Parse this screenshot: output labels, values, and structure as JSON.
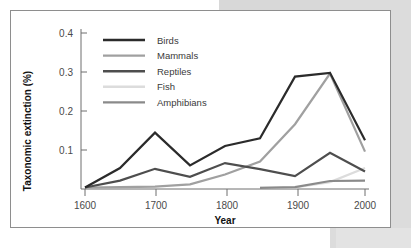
{
  "figure": {
    "background_color": "#ffffff",
    "page_background_color": "#d8d8d8",
    "border_color": "#8e8e8e"
  },
  "chart_data": {
    "type": "line",
    "title": "",
    "subtitle": "",
    "xlabel": "Year",
    "ylabel": "Taxonomic extinction (%)",
    "xlim": [
      1600,
      2000
    ],
    "ylim": [
      0,
      0.42
    ],
    "grid": false,
    "legend_position": "top-left-inside",
    "x_ticks": [
      1600,
      1700,
      1800,
      1900,
      2000
    ],
    "x_tick_labels": [
      "1600",
      "1700",
      "1800",
      "1900",
      "2000"
    ],
    "y_ticks": [
      0.1,
      0.2,
      0.3,
      0.4
    ],
    "y_tick_labels": [
      "0.1",
      "0.2",
      "0.3",
      "0.4"
    ],
    "x": [
      1600,
      1650,
      1700,
      1750,
      1800,
      1850,
      1900,
      1950,
      2000
    ],
    "series": [
      {
        "name": "Birds",
        "color": "#2b2b2b",
        "width": 2.2,
        "x": [
          1600,
          1650,
          1700,
          1750,
          1800,
          1850,
          1900,
          1950,
          2000
        ],
        "values": [
          0.004,
          0.055,
          0.148,
          0.062,
          0.113,
          0.133,
          0.295,
          0.305,
          0.128
        ]
      },
      {
        "name": "Mammals",
        "color": "#a0a0a0",
        "width": 2.2,
        "x": [
          1600,
          1650,
          1700,
          1750,
          1800,
          1850,
          1900,
          1950,
          2000
        ],
        "values": [
          0.004,
          0.005,
          0.006,
          0.012,
          0.038,
          0.072,
          0.17,
          0.303,
          0.098
        ]
      },
      {
        "name": "Reptiles",
        "color": "#4e4e4e",
        "width": 2.2,
        "x": [
          1600,
          1650,
          1700,
          1750,
          1800,
          1850,
          1900,
          1950,
          2000
        ],
        "values": [
          0.004,
          0.022,
          0.053,
          0.032,
          0.068,
          0.052,
          0.034,
          0.095,
          0.046
        ]
      },
      {
        "name": "Fish",
        "color": "#dcdcdc",
        "width": 2.2,
        "x": [
          1850,
          1900,
          1950,
          2000
        ],
        "values": [
          0.003,
          0.004,
          0.018,
          0.055
        ]
      },
      {
        "name": "Amphibians",
        "color": "#8a8a8a",
        "width": 2.2,
        "x": [
          1850,
          1900,
          1950,
          2000
        ],
        "values": [
          0.003,
          0.005,
          0.021,
          0.022
        ]
      }
    ],
    "legend": [
      {
        "label": "Birds",
        "color": "#2b2b2b"
      },
      {
        "label": "Mammals",
        "color": "#a0a0a0"
      },
      {
        "label": "Reptiles",
        "color": "#4e4e4e"
      },
      {
        "label": "Fish",
        "color": "#dcdcdc"
      },
      {
        "label": "Amphibians",
        "color": "#8a8a8a"
      }
    ]
  }
}
